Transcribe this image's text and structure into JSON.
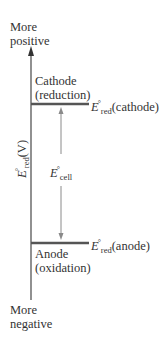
{
  "diagram": {
    "type": "energy-level",
    "axis": {
      "top_label_line1": "More",
      "top_label_line2": "positive",
      "bottom_label_line1": "More",
      "bottom_label_line2": "negative",
      "ylabel_main": "E",
      "ylabel_sup": "°",
      "ylabel_sub": "red",
      "ylabel_unit": "(V)"
    },
    "cathode": {
      "label_line1": "Cathode",
      "label_line2": "(reduction)",
      "value_main": "E",
      "value_sup": "°",
      "value_sub": "red",
      "value_suffix": "(cathode)"
    },
    "anode": {
      "label_line1": "Anode",
      "label_line2": "(oxidation)",
      "value_main": "E",
      "value_sup": "°",
      "value_sub": "red",
      "value_suffix": "(anode)"
    },
    "cell": {
      "main": "E",
      "sup": "°",
      "sub": "cell"
    },
    "colors": {
      "axis": "#555555",
      "level_line": "#555555",
      "arrow": "#8a8a8a",
      "text": "#333333"
    }
  }
}
